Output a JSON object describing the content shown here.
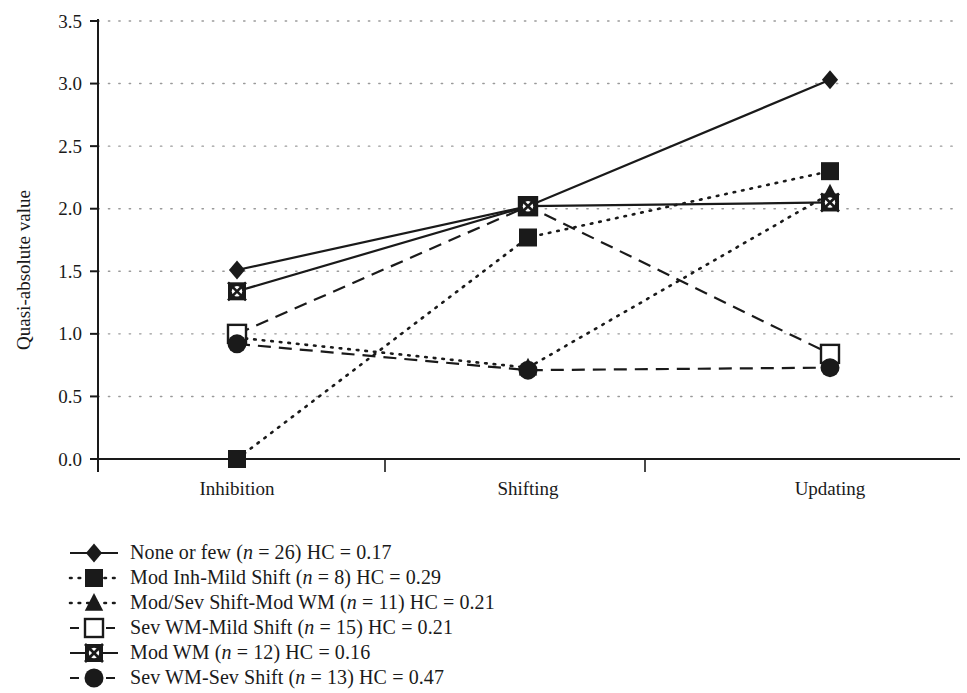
{
  "chart_data": {
    "type": "line",
    "title": "",
    "subtitle": "",
    "xlabel": "",
    "ylabel": "Quasi-absolute value",
    "categories": [
      "Inhibition",
      "Shifting",
      "Updating"
    ],
    "ylim": [
      0.0,
      3.5
    ],
    "ytick_labels": [
      "0.0",
      "0.5",
      "1.0",
      "1.5",
      "2.0",
      "2.5",
      "3.0",
      "3.5"
    ],
    "ytick_values": [
      0.0,
      0.5,
      1.0,
      1.5,
      2.0,
      2.5,
      3.0,
      3.5
    ],
    "grid": true,
    "grid_style": "dotted-horizontal",
    "legend_position": "below-left",
    "series": [
      {
        "name": "None or few",
        "legend_label": "None or few (n = 26) HC = 0.17",
        "label_prefix": "None or few (",
        "label_italic": "n",
        "label_suffix": " = 26) HC = 0.17",
        "n": 26,
        "hc": "0.17",
        "marker": "filled-diamond",
        "line": "solid",
        "values": [
          1.51,
          2.02,
          3.03
        ]
      },
      {
        "name": "Mod Inh-Mild Shift",
        "legend_label": "Mod Inh-Mild Shift (n = 8) HC = 0.29",
        "label_prefix": "Mod Inh-Mild Shift (",
        "label_italic": "n",
        "label_suffix": " = 8) HC = 0.29",
        "n": 8,
        "hc": "0.29",
        "marker": "filled-square",
        "line": "dotted",
        "values": [
          0.0,
          1.77,
          2.3
        ]
      },
      {
        "name": "Mod/Sev Shift-Mod WM",
        "legend_label": "Mod/Sev Shift-Mod WM (n = 11) HC = 0.21",
        "label_prefix": "Mod/Sev Shift-Mod WM (",
        "label_italic": "n",
        "label_suffix": " = 11) HC = 0.21",
        "n": 11,
        "hc": "0.21",
        "marker": "filled-triangle",
        "line": "dotted",
        "values": [
          0.97,
          0.73,
          2.12
        ]
      },
      {
        "name": "Sev WM-Mild Shift",
        "legend_label": "Sev WM-Mild Shift (n = 15) HC = 0.21",
        "label_prefix": "Sev WM-Mild Shift (",
        "label_italic": "n",
        "label_suffix": " = 15) HC = 0.21",
        "n": 15,
        "hc": "0.21",
        "marker": "open-square",
        "line": "dashed",
        "values": [
          1.0,
          2.02,
          0.84
        ]
      },
      {
        "name": "Mod WM",
        "legend_label": "Mod WM (n = 12) HC = 0.16",
        "label_prefix": "Mod WM (",
        "label_italic": "n",
        "label_suffix": " = 12) HC = 0.16",
        "n": 12,
        "hc": "0.16",
        "marker": "circle-x",
        "line": "solid",
        "values": [
          1.34,
          2.02,
          2.05
        ]
      },
      {
        "name": "Sev WM-Sev Shift",
        "legend_label": "Sev WM-Sev Shift (n = 13) HC = 0.47",
        "label_prefix": "Sev WM-Sev Shift (",
        "label_italic": "n",
        "label_suffix": " = 13) HC = 0.47",
        "n": 13,
        "hc": "0.47",
        "marker": "filled-circle",
        "line": "dashed",
        "values": [
          0.92,
          0.71,
          0.73
        ]
      }
    ]
  },
  "colors": {
    "ink": "#1a1a1a",
    "grid": "#9a9a9a",
    "background": "#ffffff"
  }
}
